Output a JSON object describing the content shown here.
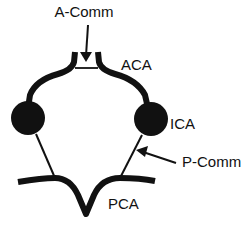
{
  "diagram": {
    "type": "anatomical-schematic",
    "colors": {
      "stroke": "#111111",
      "background": "#ffffff"
    },
    "labels": {
      "a_comm": "A-Comm",
      "aca": "ACA",
      "ica": "ICA",
      "p_comm": "P-Comm",
      "pca": "PCA"
    },
    "nodes": [
      {
        "id": "left-ica",
        "shape": "filled-circle"
      },
      {
        "id": "right-ica",
        "shape": "filled-circle"
      }
    ],
    "arrows": [
      {
        "from": "A-Comm label",
        "to": "anterior communicating segment"
      },
      {
        "from": "P-Comm label",
        "to": "right posterior communicating segment"
      }
    ]
  }
}
